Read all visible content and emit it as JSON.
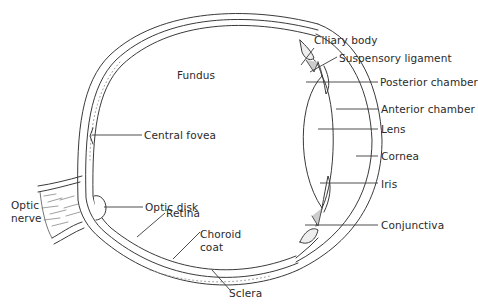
{
  "diagram": {
    "style": {
      "line_color": "#3a3a3a",
      "text_color": "#2a2a2a",
      "background": "#ffffff"
    },
    "labels": {
      "fundus": "Fundus",
      "central_fovea": "Central fovea",
      "optic_disk": "Optic disk",
      "optic_nerve": "Optic\nnerve",
      "retina": "Retina",
      "choroid_coat": "Choroid\ncoat",
      "sclera": "Sclera",
      "ciliary_body": "Ciliary body",
      "suspensory_ligament": "Suspensory ligament",
      "posterior_chamber": "Posterior chamber",
      "anterior_chamber": "Anterior chamber",
      "lens": "Lens",
      "cornea": "Cornea",
      "iris": "Iris",
      "conjunctiva": "Conjunctiva"
    }
  }
}
